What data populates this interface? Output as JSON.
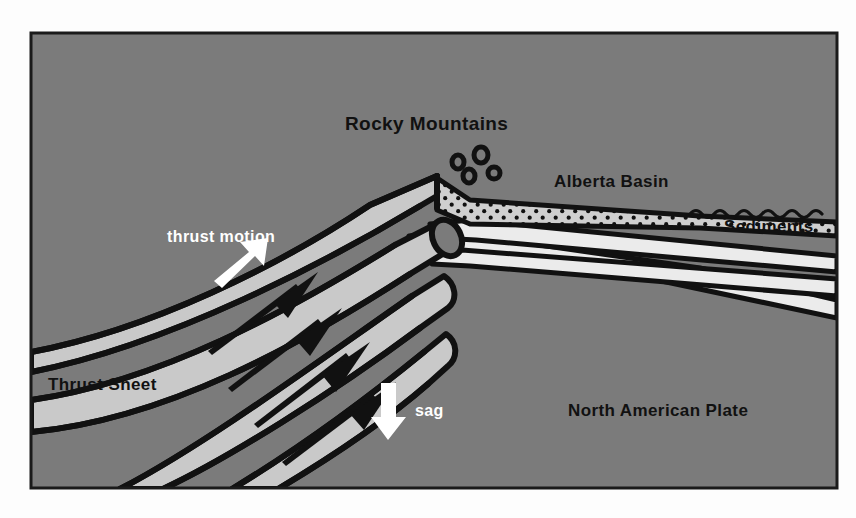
{
  "figure": {
    "kind": "geologic-cross-section",
    "title_visible": false,
    "frame": {
      "x": 30,
      "y": 32,
      "width": 808,
      "height": 457,
      "border_color": "#1a1a1a",
      "page_background": "#fdfdfd"
    }
  },
  "palette": {
    "crust_gray": "#7b7b7b",
    "thrust_band_light": "#c9c9c9",
    "wedge_white": "#ebebeb",
    "sediment_fill": "#cfcfcf",
    "outline_black": "#111111",
    "label_dark": "#111111",
    "label_light": "#ffffff"
  },
  "labels": [
    {
      "id": "rocky-mountains",
      "text": "Rocky Mountains",
      "color": "dark",
      "x": 345,
      "y": 130,
      "size": 19
    },
    {
      "id": "alberta-basin",
      "text": "Alberta Basin",
      "color": "dark",
      "x": 554,
      "y": 187,
      "size": 17
    },
    {
      "id": "sediments",
      "text": "Sediments",
      "color": "dark",
      "x": 724,
      "y": 232,
      "size": 17
    },
    {
      "id": "thrust-motion",
      "text": "thrust motion",
      "color": "light",
      "x": 167,
      "y": 242,
      "size": 16
    },
    {
      "id": "thrust-sheet",
      "text": "Thrust Sheet",
      "color": "dark",
      "x": 48,
      "y": 390,
      "size": 17
    },
    {
      "id": "sag",
      "text": "sag",
      "color": "light",
      "x": 415,
      "y": 416,
      "size": 16
    },
    {
      "id": "north-american-plate",
      "text": "North American Plate",
      "color": "dark",
      "x": 568,
      "y": 416,
      "size": 17
    }
  ],
  "arrows": [
    {
      "id": "thrust-motion-arrow",
      "direction": "up-right",
      "color": "#ffffff",
      "x": 222,
      "y": 260,
      "length": 42
    },
    {
      "id": "sag-arrow",
      "direction": "down",
      "color": "#ffffff",
      "x": 388,
      "y": 395,
      "length": 46
    }
  ],
  "units": [
    {
      "id": "north-american-plate-unit",
      "name": "North American Plate",
      "fill": "crust_gray",
      "pattern": "none"
    },
    {
      "id": "alberta-basin-sediments",
      "name": "Sediments",
      "fill": "sediment_fill",
      "pattern": "stipple-dots"
    },
    {
      "id": "thrust-sheet-slices",
      "name": "Thrust Sheet",
      "fill": "thrust_band_light",
      "pattern": "none",
      "count": 4
    },
    {
      "id": "foreland-wedges",
      "name": "Foreland wedge layers",
      "fill": "wedge_white",
      "pattern": "none",
      "count": 3
    }
  ],
  "thrust_fault_arrows": {
    "count": 4,
    "sense": "up-dip-to-the-northeast",
    "color": "#111111"
  },
  "debris_clasts": {
    "count": 4,
    "description": "eroded clasts above Rocky Mountains peak",
    "color": "#111111"
  },
  "basin_top_ornament": {
    "style": "scalloped-wavy-line",
    "description": "wavy contact at top of distal sediments"
  }
}
